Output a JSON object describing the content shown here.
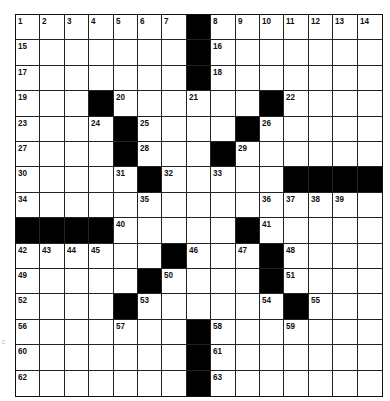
{
  "puzzle": {
    "rows": 15,
    "cols": 15,
    "colors": {
      "block": "#000000",
      "cell": "#ffffff",
      "grid_line": "#222222"
    },
    "layout": [
      "1234567#8901234",
      "x......#x......",
      "x......#x......",
      "x..#x..x..#x...",
      "x..x#x...#x....",
      "x...#x..#x.....",
      "x...x#x.x..####",
      "x....x....xxxx.",
      "####x....#x....",
      "xxxx..#x.x#x...",
      "x....#x...#x...",
      "x...#x....x#x..",
      "x...x..#x..x...",
      "x......#x......",
      "x......#x......"
    ],
    "blocks": [
      [
        0,
        7
      ],
      [
        1,
        7
      ],
      [
        2,
        7
      ],
      [
        3,
        3
      ],
      [
        3,
        10
      ],
      [
        4,
        4
      ],
      [
        4,
        9
      ],
      [
        5,
        4
      ],
      [
        5,
        8
      ],
      [
        6,
        5
      ],
      [
        6,
        11
      ],
      [
        6,
        12
      ],
      [
        6,
        13
      ],
      [
        6,
        14
      ],
      [
        8,
        0
      ],
      [
        8,
        1
      ],
      [
        8,
        2
      ],
      [
        8,
        3
      ],
      [
        8,
        9
      ],
      [
        9,
        6
      ],
      [
        9,
        10
      ],
      [
        10,
        5
      ],
      [
        10,
        10
      ],
      [
        11,
        4
      ],
      [
        11,
        11
      ],
      [
        12,
        7
      ],
      [
        13,
        7
      ],
      [
        14,
        7
      ]
    ],
    "numbers": [
      {
        "r": 0,
        "c": 0,
        "n": "1"
      },
      {
        "r": 0,
        "c": 1,
        "n": "2"
      },
      {
        "r": 0,
        "c": 2,
        "n": "3"
      },
      {
        "r": 0,
        "c": 3,
        "n": "4"
      },
      {
        "r": 0,
        "c": 4,
        "n": "5"
      },
      {
        "r": 0,
        "c": 5,
        "n": "6"
      },
      {
        "r": 0,
        "c": 6,
        "n": "7"
      },
      {
        "r": 0,
        "c": 8,
        "n": "8"
      },
      {
        "r": 0,
        "c": 9,
        "n": "9"
      },
      {
        "r": 0,
        "c": 10,
        "n": "10"
      },
      {
        "r": 0,
        "c": 11,
        "n": "11"
      },
      {
        "r": 0,
        "c": 12,
        "n": "12"
      },
      {
        "r": 0,
        "c": 13,
        "n": "13"
      },
      {
        "r": 0,
        "c": 14,
        "n": "14"
      },
      {
        "r": 1,
        "c": 0,
        "n": "15"
      },
      {
        "r": 1,
        "c": 8,
        "n": "16"
      },
      {
        "r": 2,
        "c": 0,
        "n": "17"
      },
      {
        "r": 2,
        "c": 8,
        "n": "18"
      },
      {
        "r": 3,
        "c": 0,
        "n": "19"
      },
      {
        "r": 3,
        "c": 4,
        "n": "20"
      },
      {
        "r": 3,
        "c": 7,
        "n": "21"
      },
      {
        "r": 3,
        "c": 11,
        "n": "22"
      },
      {
        "r": 4,
        "c": 0,
        "n": "23"
      },
      {
        "r": 4,
        "c": 3,
        "n": "24"
      },
      {
        "r": 4,
        "c": 5,
        "n": "25"
      },
      {
        "r": 4,
        "c": 10,
        "n": "26"
      },
      {
        "r": 5,
        "c": 0,
        "n": "27"
      },
      {
        "r": 5,
        "c": 5,
        "n": "28"
      },
      {
        "r": 5,
        "c": 9,
        "n": "29"
      },
      {
        "r": 6,
        "c": 0,
        "n": "30"
      },
      {
        "r": 6,
        "c": 4,
        "n": "31"
      },
      {
        "r": 6,
        "c": 6,
        "n": "32"
      },
      {
        "r": 6,
        "c": 8,
        "n": "33"
      },
      {
        "r": 7,
        "c": 0,
        "n": "34"
      },
      {
        "r": 7,
        "c": 5,
        "n": "35"
      },
      {
        "r": 7,
        "c": 10,
        "n": "36"
      },
      {
        "r": 7,
        "c": 11,
        "n": "37"
      },
      {
        "r": 7,
        "c": 12,
        "n": "38"
      },
      {
        "r": 7,
        "c": 13,
        "n": "39"
      },
      {
        "r": 8,
        "c": 4,
        "n": "40"
      },
      {
        "r": 8,
        "c": 10,
        "n": "41"
      },
      {
        "r": 9,
        "c": 0,
        "n": "42"
      },
      {
        "r": 9,
        "c": 1,
        "n": "43"
      },
      {
        "r": 9,
        "c": 2,
        "n": "44"
      },
      {
        "r": 9,
        "c": 3,
        "n": "45"
      },
      {
        "r": 9,
        "c": 7,
        "n": "46"
      },
      {
        "r": 9,
        "c": 9,
        "n": "47"
      },
      {
        "r": 9,
        "c": 11,
        "n": "48"
      },
      {
        "r": 10,
        "c": 0,
        "n": "49"
      },
      {
        "r": 10,
        "c": 6,
        "n": "50"
      },
      {
        "r": 10,
        "c": 11,
        "n": "51"
      },
      {
        "r": 11,
        "c": 0,
        "n": "52"
      },
      {
        "r": 11,
        "c": 5,
        "n": "53"
      },
      {
        "r": 11,
        "c": 10,
        "n": "54"
      },
      {
        "r": 11,
        "c": 12,
        "n": "55"
      },
      {
        "r": 12,
        "c": 0,
        "n": "56"
      },
      {
        "r": 12,
        "c": 4,
        "n": "57"
      },
      {
        "r": 12,
        "c": 8,
        "n": "58"
      },
      {
        "r": 12,
        "c": 11,
        "n": "59"
      },
      {
        "r": 13,
        "c": 0,
        "n": "60"
      },
      {
        "r": 13,
        "c": 8,
        "n": "61"
      },
      {
        "r": 14,
        "c": 0,
        "n": "62"
      },
      {
        "r": 14,
        "c": 8,
        "n": "63"
      }
    ]
  },
  "edge_mark": "c"
}
